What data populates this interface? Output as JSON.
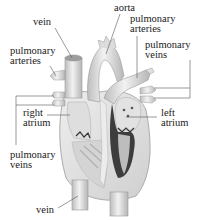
{
  "diagram": {
    "colors": {
      "tissue_light": "#e6e6e6",
      "tissue_mid": "#cfcfcf",
      "tissue_dark": "#8a8a8a",
      "chamber_dark": "#3a3a3a",
      "leader_line": "#555555",
      "text": "#1a1a1a"
    },
    "labels": {
      "vein_top": "vein",
      "aorta": "aorta",
      "pulmonary_arteries_left": "pulmonary\narteries",
      "pulmonary_arteries_right": "pulmonary\narteries",
      "pulmonary_veins_right": "pulmonary\nveins",
      "right_atrium": "right\natrium",
      "left_atrium": "left\natrium",
      "pulmonary_veins_left": "pulmonary\nveins",
      "vein_bottom": "vein"
    }
  }
}
